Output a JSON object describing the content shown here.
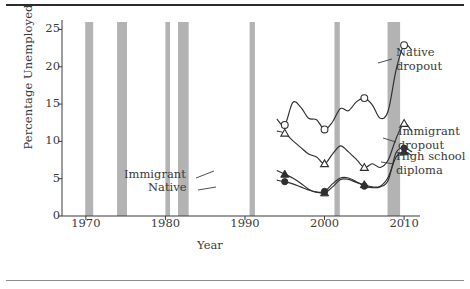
{
  "figure": {
    "top_rule_color": "#2b2b2b",
    "bottom_rule_color": "#8d8d8d",
    "background": "#ffffff"
  },
  "chart_data": {
    "type": "line",
    "title": "",
    "xlabel": "Year",
    "ylabel": "Percentage Unemployed",
    "xlim": [
      1967,
      2012
    ],
    "ylim": [
      0,
      26
    ],
    "yticks": [
      0,
      5,
      10,
      15,
      20,
      25
    ],
    "xticks": [
      1970,
      1980,
      1990,
      2000,
      2010
    ],
    "xtick_labels": [
      "1970",
      "1980",
      "1990",
      "2000",
      "2010"
    ],
    "ytick_labels": [
      "0",
      "5",
      "10",
      "15",
      "20",
      "25"
    ],
    "grid": false,
    "legend_position": "right-inline",
    "line_color": "#2f2f2f",
    "recession_band_color": "#b3b3b3",
    "recession_bands": [
      {
        "start": 1969.92,
        "end": 1970.92
      },
      {
        "start": 1973.92,
        "end": 1975.17
      },
      {
        "start": 1980.0,
        "end": 1980.58
      },
      {
        "start": 1981.58,
        "end": 1982.92
      },
      {
        "start": 1990.58,
        "end": 1991.25
      },
      {
        "start": 2001.25,
        "end": 2001.92
      },
      {
        "start": 2007.92,
        "end": 2009.5
      }
    ],
    "series": [
      {
        "name": "Native dropout",
        "label": "Native\ndropout",
        "label_line1": "Native",
        "label_line2": "dropout",
        "marker": "open-circle",
        "marker_years": [
          1995,
          2000,
          2005,
          2010
        ],
        "x": [
          1994,
          1995,
          1996,
          1997,
          1998,
          1999,
          2000,
          2001,
          2002,
          2003,
          2004,
          2005,
          2006,
          2007,
          2008,
          2009,
          2010,
          2011
        ],
        "y": [
          13.0,
          12.2,
          15.2,
          14.6,
          13.1,
          12.9,
          11.6,
          12.6,
          14.4,
          14.1,
          15.3,
          15.8,
          14.9,
          13.1,
          14.1,
          19.6,
          22.9,
          22.2
        ]
      },
      {
        "name": "Immigrant dropout",
        "label_line1": "Immigrant",
        "label_line2": "dropout",
        "marker": "open-triangle",
        "marker_years": [
          1995,
          2000,
          2005,
          2010
        ],
        "x": [
          1994,
          1995,
          1996,
          1997,
          1998,
          1999,
          2000,
          2001,
          2002,
          2003,
          2004,
          2005,
          2006,
          2007,
          2008,
          2009,
          2010,
          2011
        ],
        "y": [
          11.4,
          11.1,
          10.1,
          9.2,
          8.3,
          7.9,
          7.0,
          8.3,
          9.4,
          8.6,
          7.6,
          6.5,
          7.0,
          6.5,
          7.5,
          10.4,
          12.4,
          11.3
        ]
      },
      {
        "name": "Immigrant high school diploma",
        "label_line1": "Immigrant",
        "marker": "filled-triangle",
        "marker_years": [
          1995,
          2000,
          2005,
          2010
        ],
        "x": [
          1994,
          1995,
          1996,
          1997,
          1998,
          1999,
          2000,
          2001,
          2002,
          2003,
          2004,
          2005,
          2006,
          2007,
          2008,
          2009,
          2010,
          2011
        ],
        "y": [
          6.1,
          5.6,
          5.1,
          4.4,
          3.6,
          3.2,
          3.1,
          3.9,
          4.9,
          4.9,
          4.5,
          4.2,
          3.9,
          4.0,
          5.2,
          7.9,
          8.6,
          8.1
        ]
      },
      {
        "name": "Native high school diploma",
        "label_line1": "Native",
        "label_line2": "High school diploma",
        "marker": "filled-circle",
        "marker_years": [
          1995,
          2000,
          2005,
          2010
        ],
        "x": [
          1994,
          1995,
          1996,
          1997,
          1998,
          1999,
          2000,
          2001,
          2002,
          2003,
          2004,
          2005,
          2006,
          2007,
          2008,
          2009,
          2010,
          2011
        ],
        "y": [
          4.8,
          4.6,
          4.3,
          3.9,
          3.5,
          3.2,
          3.3,
          4.3,
          5.1,
          5.1,
          4.6,
          4.0,
          3.8,
          3.9,
          4.8,
          8.5,
          9.1,
          8.6
        ]
      }
    ],
    "annotations": [
      {
        "text": "Immigrant",
        "x": 1994,
        "y": 7.6
      },
      {
        "text": "Native",
        "x": 1995.5,
        "y": 6.2
      }
    ],
    "legend_entries": [
      {
        "line1": "Native",
        "line2": "dropout",
        "marker": "open-circle"
      },
      {
        "line1": "Immigrant",
        "line2": "dropout",
        "marker": "open-triangle"
      },
      {
        "line1": "High school",
        "line2": "diploma",
        "marker": "filled-triangle-circle"
      }
    ]
  }
}
